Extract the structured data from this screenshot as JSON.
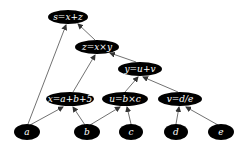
{
  "diagram": {
    "type": "computational-graph",
    "nodes": [
      {
        "id": "s",
        "label": "s=x+z",
        "cx": 68,
        "cy": 17,
        "rx": 20,
        "ry": 7
      },
      {
        "id": "z",
        "label": "z=x×y",
        "cx": 97,
        "cy": 47,
        "rx": 22,
        "ry": 7
      },
      {
        "id": "y",
        "label": "y=u+v",
        "cx": 140,
        "cy": 69,
        "rx": 22,
        "ry": 7
      },
      {
        "id": "x",
        "label": "x=a+b+5",
        "cx": 70,
        "cy": 99,
        "rx": 24,
        "ry": 7
      },
      {
        "id": "u",
        "label": "u=b×c",
        "cx": 125,
        "cy": 99,
        "rx": 23,
        "ry": 7
      },
      {
        "id": "v",
        "label": "v=d/e",
        "cx": 180,
        "cy": 99,
        "rx": 22,
        "ry": 7
      },
      {
        "id": "a",
        "label": "a",
        "cx": 27,
        "cy": 132,
        "rx": 13,
        "ry": 8
      },
      {
        "id": "b",
        "label": "b",
        "cx": 87,
        "cy": 132,
        "rx": 13,
        "ry": 8
      },
      {
        "id": "c",
        "label": "c",
        "cx": 131,
        "cy": 132,
        "rx": 12,
        "ry": 8
      },
      {
        "id": "d",
        "label": "d",
        "cx": 176,
        "cy": 132,
        "rx": 12,
        "ry": 8
      },
      {
        "id": "e",
        "label": "e",
        "cx": 221,
        "cy": 132,
        "rx": 13,
        "ry": 8
      }
    ],
    "edges": [
      {
        "from": "a",
        "to": "s",
        "x1": 28,
        "y1": 124,
        "x2": 66,
        "y2": 25
      },
      {
        "from": "z",
        "to": "s",
        "x1": 95,
        "y1": 40,
        "x2": 78,
        "y2": 24
      },
      {
        "from": "x",
        "to": "z",
        "x1": 73,
        "y1": 92,
        "x2": 95,
        "y2": 55
      },
      {
        "from": "y",
        "to": "z",
        "x1": 136,
        "y1": 62,
        "x2": 110,
        "y2": 53
      },
      {
        "from": "u",
        "to": "y",
        "x1": 125,
        "y1": 92,
        "x2": 138,
        "y2": 77
      },
      {
        "from": "v",
        "to": "y",
        "x1": 178,
        "y1": 92,
        "x2": 143,
        "y2": 77
      },
      {
        "from": "a",
        "to": "x",
        "x1": 30,
        "y1": 125,
        "x2": 63,
        "y2": 107
      },
      {
        "from": "b",
        "to": "x",
        "x1": 85,
        "y1": 125,
        "x2": 73,
        "y2": 107
      },
      {
        "from": "b",
        "to": "u",
        "x1": 90,
        "y1": 125,
        "x2": 120,
        "y2": 107
      },
      {
        "from": "c",
        "to": "u",
        "x1": 131,
        "y1": 124,
        "x2": 127,
        "y2": 107
      },
      {
        "from": "d",
        "to": "v",
        "x1": 176,
        "y1": 124,
        "x2": 179,
        "y2": 107
      },
      {
        "from": "e",
        "to": "v",
        "x1": 218,
        "y1": 125,
        "x2": 186,
        "y2": 107
      }
    ]
  }
}
